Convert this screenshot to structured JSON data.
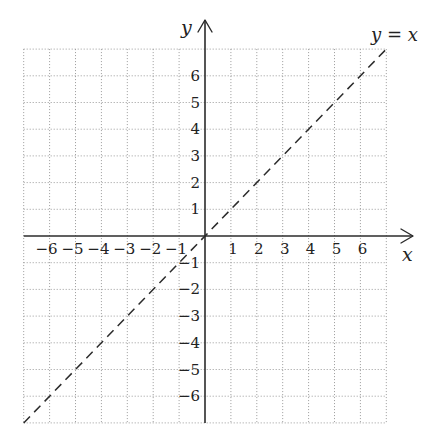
{
  "chart_data": {
    "type": "line",
    "title": "",
    "xlabel": "x",
    "ylabel": "y",
    "xlim": [
      -7,
      7
    ],
    "ylim": [
      -7,
      7
    ],
    "grid": true,
    "grid_style": "dotted",
    "x_ticks": [
      -6,
      -5,
      -4,
      -3,
      -2,
      -1,
      1,
      2,
      3,
      4,
      5,
      6
    ],
    "y_ticks": [
      -6,
      -5,
      -4,
      -3,
      -2,
      -1,
      1,
      2,
      3,
      4,
      5,
      6
    ],
    "x_tick_labels": [
      "−6",
      "−5",
      "−4",
      "−3",
      "−2",
      "−1",
      "1",
      "2",
      "3",
      "4",
      "5",
      "6"
    ],
    "y_tick_labels": [
      "−6",
      "−5",
      "−4",
      "−3",
      "−2",
      "−1",
      "1",
      "2",
      "3",
      "4",
      "5",
      "6"
    ],
    "series": [
      {
        "name": "y = x",
        "style": "dashed",
        "color": "#2b2b2b",
        "x": [
          -7,
          7
        ],
        "y": [
          -7,
          7
        ]
      }
    ],
    "annotations": [
      {
        "text": "y = x",
        "x": 7,
        "y": 7.4
      }
    ],
    "legend": "none"
  },
  "labels": {
    "x_axis": "x",
    "y_axis": "y",
    "series_lhs": "y",
    "series_eq": " = ",
    "series_rhs": "x"
  },
  "colors": {
    "axis": "#2b2b2b",
    "grid": "#9a9a9a",
    "series": "#2b2b2b",
    "background": "#ffffff"
  }
}
